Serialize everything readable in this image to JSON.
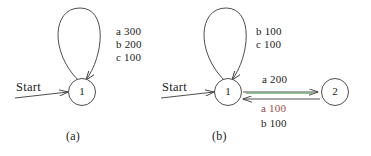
{
  "figure": {
    "background_color": "#ffffff",
    "stroke_color": "#3a3a3a",
    "text_color": "#222222",
    "highlight_color": "#3ea33e",
    "accent_text_color": "#9c4a4a",
    "panels": [
      {
        "id": "a",
        "caption": "(a)",
        "start_label": "Start",
        "states": [
          {
            "id": "s1",
            "label": "1"
          }
        ],
        "self_loop": {
          "on_state": "1",
          "labels": [
            "a 300",
            "b 200",
            "c 100"
          ]
        },
        "transitions": []
      },
      {
        "id": "b",
        "caption": "(b)",
        "start_label": "Start",
        "states": [
          {
            "id": "s1",
            "label": "1"
          },
          {
            "id": "s2",
            "label": "2"
          }
        ],
        "self_loop": {
          "on_state": "1",
          "labels": [
            "b 100",
            "c 100"
          ]
        },
        "transitions": [
          {
            "from": "1",
            "to": "2",
            "label": "a 200",
            "highlighted": true,
            "label_accent": false
          },
          {
            "from": "2",
            "to": "1",
            "labels": [
              "a 100",
              "b 100"
            ],
            "highlighted": false,
            "label_accent": true
          }
        ]
      }
    ]
  }
}
